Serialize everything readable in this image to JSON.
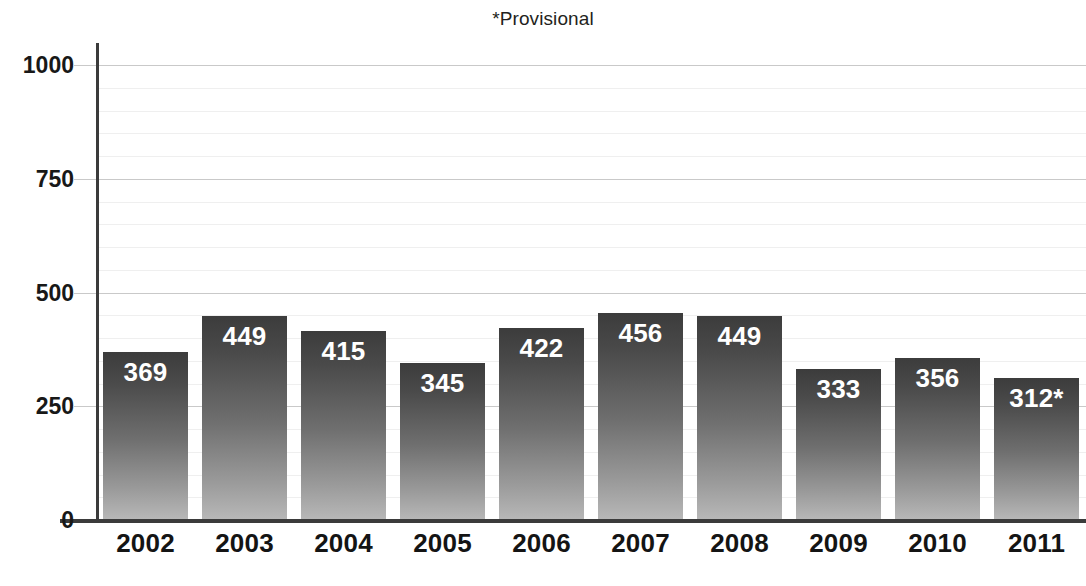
{
  "chart_data": {
    "type": "bar",
    "title": "*Provisional",
    "subtitle": "",
    "xlabel": "",
    "ylabel": "",
    "categories": [
      "2002",
      "2003",
      "2004",
      "2005",
      "2006",
      "2007",
      "2008",
      "2009",
      "2010",
      "2011"
    ],
    "values": [
      369,
      449,
      415,
      345,
      422,
      456,
      449,
      333,
      356,
      312
    ],
    "value_labels": [
      "369",
      "449",
      "415",
      "345",
      "422",
      "456",
      "449",
      "333",
      "356",
      "312*"
    ],
    "ylim": [
      0,
      1000
    ],
    "ytick_labels": [
      "1000",
      "750",
      "500",
      "250",
      "0"
    ],
    "ytick_values": [
      1000,
      750,
      500,
      250,
      0
    ],
    "minor_tick_step": 50,
    "grid": "horizontal",
    "legend": "none",
    "annotations": [
      "*Provisional"
    ],
    "colors": {
      "bar_top": "#3c3c3c",
      "bar_bottom": "#b8b8b8",
      "axis": "#3b3b3b",
      "major_gridline": "#c9c9c9",
      "minor_gridline": "#efefef",
      "value_label": "#ffffff",
      "tick_label": "#141414",
      "title": "#231f20",
      "background": "#ffffff"
    }
  }
}
